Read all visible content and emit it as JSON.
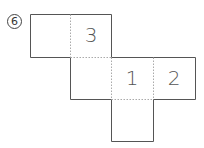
{
  "problem": {
    "label": "6"
  },
  "net": {
    "cell_size": 42,
    "cells": [
      {
        "id": "a",
        "x": 30,
        "y": 14,
        "text": ""
      },
      {
        "id": "b",
        "x": 70,
        "y": 14,
        "text": "3"
      },
      {
        "id": "c",
        "x": 70,
        "y": 57,
        "text": ""
      },
      {
        "id": "d",
        "x": 111,
        "y": 57,
        "text": "1"
      },
      {
        "id": "e",
        "x": 153,
        "y": 57,
        "text": "2"
      },
      {
        "id": "f",
        "x": 111,
        "y": 99,
        "text": ""
      }
    ],
    "colors": {
      "solid": "#555555",
      "dotted": "#aaaaaa"
    }
  }
}
